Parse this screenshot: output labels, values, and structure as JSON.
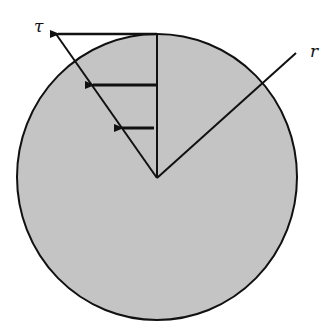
{
  "diagram": {
    "labels": {
      "tau": "τ",
      "r": "r"
    },
    "colors": {
      "fill": "#c4c4c4",
      "stroke": "#111111",
      "background": "#ffffff"
    },
    "circle": {
      "cx": 157,
      "cy": 177,
      "rx": 140,
      "ry": 143
    },
    "arrows": [
      {
        "y": 34,
        "from_x": 157,
        "to_x": 56
      },
      {
        "y": 85,
        "from_x": 157,
        "to_x": 92
      },
      {
        "y": 128,
        "from_x": 154,
        "to_x": 121
      }
    ]
  }
}
